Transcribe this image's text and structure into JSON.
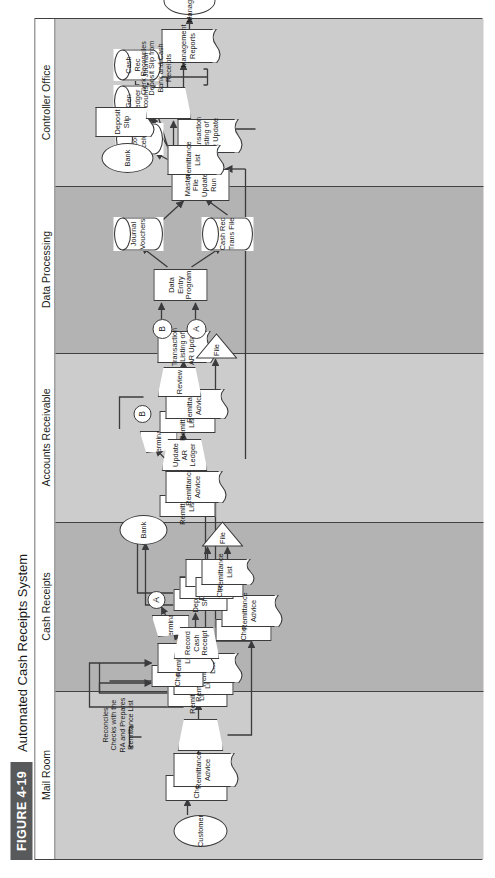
{
  "figure": {
    "tag": "FIGURE 4-19",
    "title": "Automated Cash Receipts System"
  },
  "colors": {
    "band_dark": "#b3b3b3",
    "band_light": "#cccccc",
    "tag_bg": "#58595b",
    "line": "#3b3b3d",
    "shape_fill": "#ffffff"
  },
  "lanes": [
    {
      "id": "mail-room",
      "label": "Mail Room",
      "shade": "light"
    },
    {
      "id": "cash-receipts",
      "label": "Cash Receipts",
      "shade": "dark"
    },
    {
      "id": "accounts-receivable",
      "label": "Accounts Receivable",
      "shade": "light"
    },
    {
      "id": "data-processing",
      "label": "Data Processing",
      "shade": "dark"
    },
    {
      "id": "controller-office",
      "label": "Controller Office",
      "shade": "light"
    }
  ],
  "nodes": {
    "mail_room": {
      "customer": "Customer",
      "check_1": "Check",
      "remittance_advice_1": "Remittance Advice",
      "process_reconcile": "",
      "annotation": "Reconciles Checks with the RA and Prepares Remittance List",
      "remittance_list_1": "Remittance List",
      "remittance_list_2": "Remittance List",
      "remittance_list_3": "Remittance List",
      "check_2": "Check",
      "remittance_advice_2": "Remittance Advice"
    },
    "cash_receipts": {
      "check": "Check",
      "remittance_list": "Remittance List",
      "terminal": "Terminal",
      "connector_a": "A",
      "record_cash_receipt": "Record Cash Receipt",
      "deposit_slip_1": "Deposit Slip",
      "deposit_slip_2": "Deposit Slip",
      "deposit_slip_3": "Deposit Slip",
      "check_out": "Check",
      "remittance_list_out": "Remittance List",
      "bank": "Bank",
      "file": "File"
    },
    "accounts_receivable": {
      "remittance_list_in": "Remittance List",
      "remittance_advice_in": "Remittance Advice",
      "terminal": "Terminal",
      "connector_b": "B",
      "update_ar_ledger": "Update AR Ledger",
      "remittance_list_2": "Remittance List",
      "remittance_advice_2": "Remittance Advice",
      "review": "Review",
      "transaction_listing": "Transaction Listing of AR Update",
      "file": "File"
    },
    "data_processing": {
      "connector_a": "A",
      "connector_b": "B",
      "data_entry_program": "Data Entry Program",
      "journal_vouchers": "Journal Vouchers",
      "cash_rec_trans_file": "Cash Rec Trans File",
      "master_file_update_run": "Master File Update Run",
      "accounts_receivable_db": "Accounts Receivable",
      "gen_ledger_accounts_db": "Gen Ledger Accounts",
      "cash_rec_journal_db": "Cash Rec Journal",
      "transaction_listing": "Transaction Listing of AR Update",
      "management_reports": "Management Reports",
      "management": "Management"
    },
    "controller_office": {
      "bank": "Bank",
      "deposit_slip": "Deposit Slip",
      "remittance_list": "Remittance List",
      "reconcile_process": "",
      "annotation": "Clerk Reconciles Deposit Slip from Bank and Cash Receipts"
    }
  }
}
